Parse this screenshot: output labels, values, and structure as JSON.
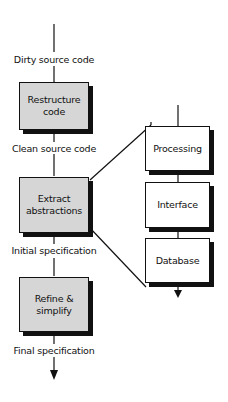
{
  "diagram": {
    "main_flow": {
      "labels": [
        "Dirty source code",
        "Clean source code",
        "Initial specification",
        "Final specification"
      ],
      "steps": [
        "Restructure\ncode",
        "Extract\nabstractions",
        "Refine &\nsimplify"
      ]
    },
    "abstraction_stack": {
      "items": [
        "Processing",
        "Interface",
        "Database"
      ]
    },
    "colors": {
      "step_fill": "#d6d6d6",
      "stack_fill": "#ffffff",
      "line": "#111111"
    }
  }
}
